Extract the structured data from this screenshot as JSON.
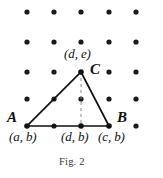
{
  "figure": {
    "caption": "Fig. 2",
    "type": "geometry-diagram",
    "colors": {
      "ink": "#111111",
      "dot": "#1a1a1a",
      "dashed": "#8a8a8a",
      "background": "#ffffff",
      "caption": "#3a3a3a"
    },
    "labels": {
      "vertex_a": "A",
      "vertex_b": "B",
      "vertex_c": "C",
      "coord_c": "(d, e)",
      "coord_a": "(a, b)",
      "coord_foot": "(d, b)",
      "coord_b": "(c, b)"
    },
    "grid": {
      "columns_x": [
        27,
        54,
        81,
        109,
        136
      ],
      "rows_y": [
        12,
        42,
        72,
        99,
        126
      ],
      "dot_radius": 2.6
    },
    "triangle": {
      "vertices": [
        {
          "name": "A",
          "x": 27,
          "y": 126
        },
        {
          "name": "B",
          "x": 109,
          "y": 126
        },
        {
          "name": "C",
          "x": 81,
          "y": 72
        }
      ],
      "altitude_foot": {
        "x": 81,
        "y": 126
      },
      "stroke_width": 1.6
    }
  }
}
